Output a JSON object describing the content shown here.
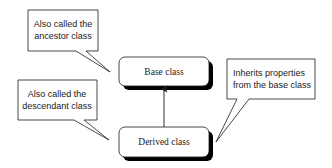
{
  "diagram": {
    "type": "class-inheritance",
    "classes": [
      {
        "id": "base",
        "label": "Base class"
      },
      {
        "id": "derived",
        "label": "Derived class"
      }
    ],
    "relationships": [
      {
        "from": "derived",
        "to": "base",
        "type": "inherits-arrow"
      }
    ],
    "callouts": [
      {
        "id": "ancestor-note",
        "target": "base",
        "lines": [
          "Also called the",
          "ancestor class"
        ]
      },
      {
        "id": "descendant-note",
        "target": "derived",
        "lines": [
          "Also called the",
          "descendant class"
        ]
      },
      {
        "id": "inherits-note",
        "target": "derived",
        "lines": [
          "Inherits properties",
          "from the base class"
        ]
      }
    ],
    "colors": {
      "stroke": "#1a1a1a",
      "shadow": "#000000",
      "fill": "#ffffff"
    }
  }
}
